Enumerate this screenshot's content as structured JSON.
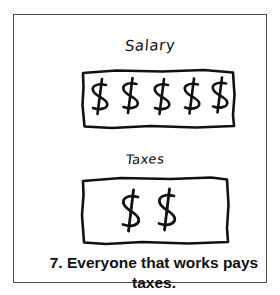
{
  "page": {
    "background_color": "#ffffff",
    "frame_color": "#4a4a4a",
    "ink_color": "#111111"
  },
  "illustration": {
    "salary": {
      "label": "Salary",
      "label_style": "handwritten",
      "box_name": "salary-money-box",
      "currency_symbol": "$",
      "count": 5,
      "symbols": [
        "$",
        "$",
        "$",
        "$",
        "$"
      ]
    },
    "taxes": {
      "label": "Taxes",
      "label_style": "handwritten",
      "box_name": "taxes-money-box",
      "currency_symbol": "$",
      "count": 2,
      "symbols": [
        "$",
        "$"
      ]
    }
  },
  "caption": {
    "number": "7.",
    "line1": "7.  Everyone that works pays",
    "line2": "taxes.",
    "full_text": "7. Everyone that works pays taxes."
  }
}
